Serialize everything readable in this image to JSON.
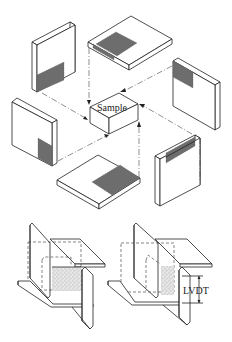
{
  "diagram": {
    "center_label": "Sample",
    "lvdt_label": "LVDT",
    "specimens": [
      {
        "id": "top-left-vertical-block",
        "shaded_region": "bottom"
      },
      {
        "id": "top-horizontal-plate",
        "shaded_region": "front-left"
      },
      {
        "id": "right-vertical-block",
        "shaded_region": "top-left"
      },
      {
        "id": "left-vertical-block",
        "shaded_region": "bottom-right"
      },
      {
        "id": "bottom-horizontal-plate",
        "shaded_region": "right"
      },
      {
        "id": "bottom-right-vertical-block",
        "shaded_region": "top"
      }
    ],
    "test_setups": [
      {
        "id": "shear-setup-before",
        "has_lvdt": false
      },
      {
        "id": "shear-setup-displaced",
        "has_lvdt": true
      }
    ],
    "colors": {
      "line": "#222222",
      "shade": "#6d6d6d",
      "background": "#ffffff"
    }
  }
}
